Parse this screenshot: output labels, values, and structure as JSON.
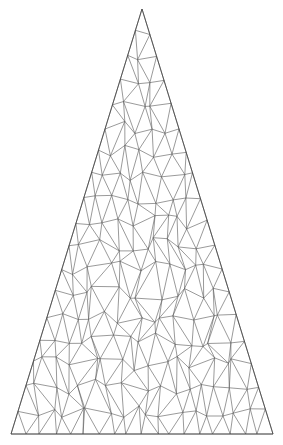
{
  "diagram": {
    "type": "triangular-mesh",
    "shape": "isosceles-triangle",
    "apex": [
      142,
      9
    ],
    "base_left": [
      11,
      434
    ],
    "base_right": [
      273,
      434
    ],
    "rows": 18,
    "jitter": 0.32,
    "seed": 7,
    "stroke_color": "#555555",
    "background": "#ffffff"
  }
}
